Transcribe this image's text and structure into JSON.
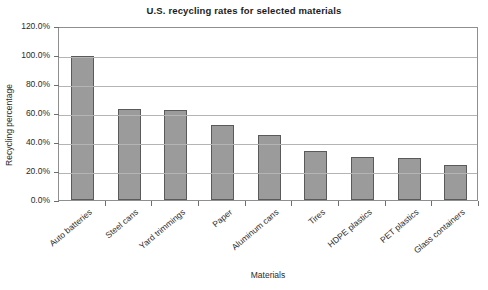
{
  "chart_data": {
    "type": "bar",
    "title": "U.S. recycling rates for selected materials",
    "xlabel": "Materials",
    "ylabel": "Recycling percentage",
    "categories": [
      "Auto batteries",
      "Steel cans",
      "Yard trimmings",
      "Paper",
      "Aluminum cans",
      "Tires",
      "HDPE plastics",
      "PET plastics",
      "Glass containers"
    ],
    "values": [
      99.0,
      62.5,
      62.0,
      51.5,
      44.5,
      33.8,
      29.8,
      29.3,
      24.3
    ],
    "value_labels": [
      "99.0%",
      "62.5%",
      "62.0%",
      "51.5%",
      "44.5%",
      "33.8%",
      "29.8%",
      "29.3%",
      "24.3%"
    ],
    "ylim": [
      0,
      120
    ],
    "ytick_values": [
      0,
      20,
      40,
      60,
      80,
      100,
      120
    ],
    "ytick_labels": [
      "0.0%",
      "20.0%",
      "40.0%",
      "60.0%",
      "80.0%",
      "100.0%",
      "120.0%"
    ],
    "grid": true,
    "legend": null,
    "legend_position": "none",
    "series": [
      {
        "name": "Recycling percentage",
        "values": [
          99.0,
          62.5,
          62.0,
          51.5,
          44.5,
          33.8,
          29.8,
          29.3,
          24.3
        ]
      }
    ],
    "colors": {
      "bar_fill": "#9b9b9b",
      "bar_border": "#5a5a5a",
      "gridline": "#b4b4b4",
      "axis": "#8f8f8f",
      "text": "#2b2b2b",
      "background": "#ffffff"
    }
  }
}
